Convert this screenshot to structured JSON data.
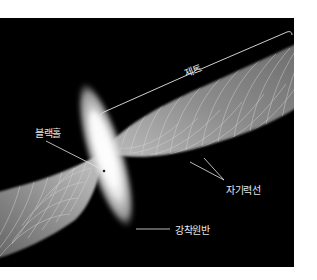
{
  "diagram": {
    "title": "",
    "background": "#000000",
    "labels": {
      "jet": "제트",
      "black_hole": "블랙홀",
      "magnetic_field_lines": "자기력선",
      "accretion_disk": "강착원반"
    },
    "colors": {
      "line": "#e6e6e6",
      "jet_fill": "#8a8a8a",
      "disk_core": "#ffffff"
    }
  }
}
